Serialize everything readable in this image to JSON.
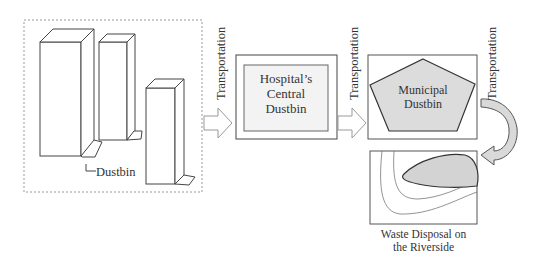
{
  "diagram": {
    "stages": [
      {
        "id": "wards",
        "label": "Dustbin",
        "shape": "buildings-with-dustbins"
      },
      {
        "id": "central",
        "label": "Hospital’s Central Dustbin",
        "lines": [
          "Hospital’s",
          "Central",
          "Dustbin"
        ],
        "shape": "rectangle"
      },
      {
        "id": "municipal",
        "label": "Municipal Dustbin",
        "lines": [
          "Municipal",
          "Dustbin"
        ],
        "shape": "pentagon"
      },
      {
        "id": "disposal",
        "label": "Waste Disposal on the Riverside",
        "lines": [
          "Waste Disposal on",
          "the Riverside"
        ],
        "shape": "river-bank"
      }
    ],
    "edges": [
      {
        "from": "wards",
        "to": "central",
        "label": "Transportation"
      },
      {
        "from": "central",
        "to": "municipal",
        "label": "Transportation"
      },
      {
        "from": "municipal",
        "to": "disposal",
        "label": "Transportation"
      }
    ],
    "colors": {
      "stroke": "#444444",
      "fill_gray": "#d9d9d9",
      "dashed": "#999999"
    }
  }
}
